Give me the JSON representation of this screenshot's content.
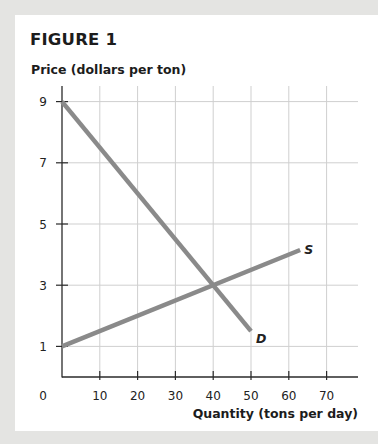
{
  "figure": {
    "title": "FIGURE 1"
  },
  "chart_data": {
    "type": "line",
    "title": "FIGURE 1",
    "xlabel": "Quantity (tons per day)",
    "ylabel": "Price (dollars per ton)",
    "x_ticks": [
      0,
      10,
      20,
      30,
      40,
      50,
      60,
      70
    ],
    "y_ticks": [
      1,
      3,
      5,
      7,
      9
    ],
    "origin_label": "0",
    "xlim": [
      0,
      78
    ],
    "ylim": [
      0,
      9.3
    ],
    "grid": true,
    "series": [
      {
        "name": "D",
        "label": "D",
        "points": [
          [
            0,
            9
          ],
          [
            50,
            1.5
          ]
        ],
        "color": "#8a8a8a"
      },
      {
        "name": "S",
        "label": "S",
        "points": [
          [
            0,
            1
          ],
          [
            63,
            4.15
          ]
        ],
        "color": "#8a8a8a"
      }
    ],
    "equilibrium": {
      "x": 40,
      "y": 3
    }
  }
}
